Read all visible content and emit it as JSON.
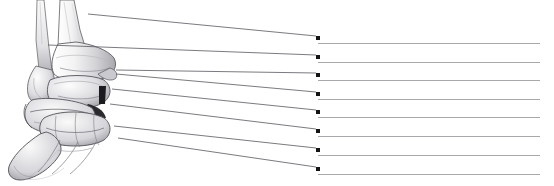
{
  "worksheet": {
    "title": "Ankle and Foot Skeleton Labeling Exercise",
    "view": "Lateral view of the right ankle and foot skeleton",
    "background_color": "#ffffff",
    "illustration_style": "grayscale pencil-shaded anatomical drawing",
    "line_color": "#a9a9ad",
    "dot_color": "#141414",
    "leader_color": "#555555"
  },
  "illustration": {
    "name": "ankle-foot-skeleton-drawing",
    "structures": [
      {
        "name": "fibula-shaft",
        "label": ""
      },
      {
        "name": "tibia-shaft",
        "label": ""
      },
      {
        "name": "lateral-malleolus",
        "label": ""
      },
      {
        "name": "medial-malleolus",
        "label": ""
      },
      {
        "name": "talus",
        "label": ""
      },
      {
        "name": "calcaneus",
        "label": ""
      },
      {
        "name": "navicular",
        "label": ""
      },
      {
        "name": "cuboid",
        "label": ""
      },
      {
        "name": "cuneiforms",
        "label": ""
      },
      {
        "name": "metatarsals",
        "label": ""
      }
    ]
  },
  "answers": [
    {
      "index": 1,
      "value": "",
      "dot_y": 36,
      "line_length": 222
    },
    {
      "index": 2,
      "value": "",
      "dot_y": 55,
      "line_length": 222
    },
    {
      "index": 3,
      "value": "",
      "dot_y": 73,
      "line_length": 222
    },
    {
      "index": 4,
      "value": "",
      "dot_y": 92,
      "line_length": 222
    },
    {
      "index": 5,
      "value": "",
      "dot_y": 110,
      "line_length": 222
    },
    {
      "index": 6,
      "value": "",
      "dot_y": 129,
      "line_length": 222
    },
    {
      "index": 7,
      "value": "",
      "dot_y": 148,
      "line_length": 222
    },
    {
      "index": 8,
      "value": "",
      "dot_y": 167,
      "line_length": 222
    }
  ],
  "leaders": [
    {
      "index": 1,
      "from_x": 88,
      "from_y": 14,
      "to_x": 316,
      "to_y": 36
    },
    {
      "index": 2,
      "from_x": 48,
      "from_y": 45,
      "to_x": 316,
      "to_y": 55
    },
    {
      "index": 3,
      "from_x": 116,
      "from_y": 70,
      "to_x": 316,
      "to_y": 73
    },
    {
      "index": 4,
      "from_x": 116,
      "from_y": 74,
      "to_x": 316,
      "to_y": 92
    },
    {
      "index": 5,
      "from_x": 112,
      "from_y": 89,
      "to_x": 316,
      "to_y": 110
    },
    {
      "index": 6,
      "from_x": 110,
      "from_y": 104,
      "to_x": 316,
      "to_y": 129
    },
    {
      "index": 7,
      "from_x": 114,
      "from_y": 126,
      "to_x": 316,
      "to_y": 148
    },
    {
      "index": 8,
      "from_x": 118,
      "from_y": 138,
      "to_x": 316,
      "to_y": 167
    }
  ]
}
